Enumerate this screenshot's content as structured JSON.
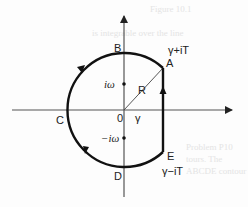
{
  "diagram": {
    "type": "contour-integral",
    "axes": {
      "origin_label": "0"
    },
    "points": {
      "A": {
        "label": "A",
        "annotation": "γ+iT"
      },
      "B": {
        "label": "B"
      },
      "C": {
        "label": "C"
      },
      "D": {
        "label": "D"
      },
      "E": {
        "label": "E",
        "annotation": "γ−iT"
      }
    },
    "poles": {
      "upper": "iω",
      "lower": "−iω"
    },
    "radius_label": "R",
    "gamma_label": "γ",
    "background_text": {
      "top": "Figure 10.1",
      "line1": "is integrable over the line",
      "right_lines": [
        "Problem P10",
        "tours. The",
        "ABCDE contour"
      ]
    }
  }
}
